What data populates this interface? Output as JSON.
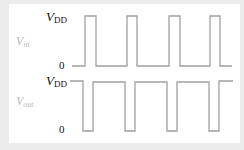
{
  "diagram": {
    "title": "",
    "top_waveform": {
      "signal_label": "V",
      "signal_sub": "in",
      "high_label": "V",
      "high_sub": "DD",
      "low_label": "0",
      "pulses": "positive",
      "pulse_count": 4
    },
    "bottom_waveform": {
      "signal_label": "V",
      "signal_sub": "out",
      "high_label": "V",
      "high_sub": "DD",
      "low_label": "0",
      "pulses": "inverted (negative)",
      "pulse_count": 4
    },
    "colors": {
      "waveform": "#a0a0a0",
      "signal_label": "#b8b8b8",
      "background": "#ececec",
      "panel": "#ffffff"
    }
  }
}
